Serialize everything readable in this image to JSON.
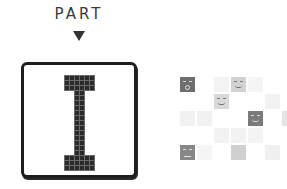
{
  "header": {
    "title": "PART",
    "arrow": "down-triangle"
  },
  "preview": {
    "glyph": "I",
    "cell_size": 5,
    "pixels": [
      [
        0,
        0
      ],
      [
        1,
        0
      ],
      [
        2,
        0
      ],
      [
        3,
        0
      ],
      [
        4,
        0
      ],
      [
        5,
        0
      ],
      [
        0,
        1
      ],
      [
        1,
        1
      ],
      [
        2,
        1
      ],
      [
        3,
        1
      ],
      [
        4,
        1
      ],
      [
        5,
        1
      ],
      [
        0,
        2
      ],
      [
        1,
        2
      ],
      [
        2,
        2
      ],
      [
        3,
        2
      ],
      [
        4,
        2
      ],
      [
        5,
        2
      ],
      [
        2,
        3
      ],
      [
        3,
        3
      ],
      [
        2,
        4
      ],
      [
        3,
        4
      ],
      [
        2,
        5
      ],
      [
        3,
        5
      ],
      [
        2,
        6
      ],
      [
        3,
        6
      ],
      [
        2,
        7
      ],
      [
        3,
        7
      ],
      [
        2,
        8
      ],
      [
        3,
        8
      ],
      [
        2,
        9
      ],
      [
        3,
        9
      ],
      [
        2,
        10
      ],
      [
        3,
        10
      ],
      [
        2,
        11
      ],
      [
        3,
        11
      ],
      [
        2,
        12
      ],
      [
        3,
        12
      ],
      [
        2,
        13
      ],
      [
        3,
        13
      ],
      [
        2,
        14
      ],
      [
        3,
        14
      ],
      [
        2,
        15
      ],
      [
        3,
        15
      ],
      [
        0,
        16
      ],
      [
        1,
        16
      ],
      [
        2,
        16
      ],
      [
        3,
        16
      ],
      [
        4,
        16
      ],
      [
        5,
        16
      ],
      [
        0,
        17
      ],
      [
        1,
        17
      ],
      [
        2,
        17
      ],
      [
        3,
        17
      ],
      [
        4,
        17
      ],
      [
        5,
        17
      ],
      [
        0,
        18
      ],
      [
        1,
        18
      ],
      [
        2,
        18
      ],
      [
        3,
        18
      ],
      [
        4,
        18
      ],
      [
        5,
        18
      ]
    ],
    "colors": {
      "pixel": "#2a2a2a",
      "frame": "#1e1e1e"
    }
  },
  "tile_grid": {
    "cell_pitch": 17,
    "tiles": [
      {
        "col": 0,
        "row": 0,
        "shade": "#6e6e6e",
        "face": "surprised"
      },
      {
        "col": 2,
        "row": 0,
        "shade": "#f3f3f3",
        "face": null
      },
      {
        "col": 3,
        "row": 0,
        "shade": "#d2d2d2",
        "face": "smile-dark"
      },
      {
        "col": 4,
        "row": 0,
        "shade": "#f5f5f5",
        "face": null
      },
      {
        "col": 2,
        "row": 1,
        "shade": "#d9d9d9",
        "face": "smile-dark"
      },
      {
        "col": 5,
        "row": 1,
        "shade": "#f2f2f2",
        "face": null
      },
      {
        "col": 0,
        "row": 2,
        "shade": "#f1f1f1",
        "face": null
      },
      {
        "col": 1,
        "row": 2,
        "shade": "#f1f1f1",
        "face": null
      },
      {
        "col": 4,
        "row": 2,
        "shade": "#7a7a7a",
        "face": "grin"
      },
      {
        "col": 6,
        "row": 2,
        "shade": "#e4e4e4",
        "face": null
      },
      {
        "col": 2,
        "row": 3,
        "shade": "#f2f2f2",
        "face": null
      },
      {
        "col": 3,
        "row": 3,
        "shade": "#f2f2f2",
        "face": null
      },
      {
        "col": 4,
        "row": 3,
        "shade": "#f4f4f4",
        "face": null
      },
      {
        "col": 0,
        "row": 4,
        "shade": "#878787",
        "face": "squint"
      },
      {
        "col": 1,
        "row": 4,
        "shade": "#f5f5f5",
        "face": null
      },
      {
        "col": 3,
        "row": 4,
        "shade": "#d0d0d0",
        "face": null
      },
      {
        "col": 5,
        "row": 4,
        "shade": "#f0f0f0",
        "face": null
      }
    ]
  }
}
